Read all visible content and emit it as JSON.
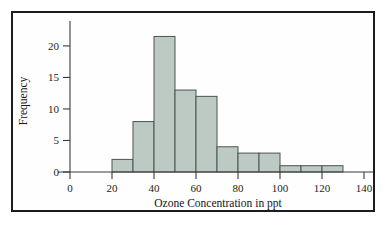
{
  "chart_data": {
    "type": "bar",
    "title": "",
    "subtitle": "",
    "xlabel": "Ozone Concentration in ppt",
    "ylabel": "Frequency",
    "xlim": [
      0,
      140
    ],
    "ylim": [
      0,
      23
    ],
    "bin_width": 10,
    "grid": false,
    "legend": null,
    "categories": [
      "20-30",
      "30-40",
      "40-50",
      "50-60",
      "60-70",
      "70-80",
      "80-90",
      "90-100",
      "100-110",
      "110-120",
      "120-130"
    ],
    "bin_starts": [
      20,
      30,
      40,
      50,
      60,
      70,
      80,
      90,
      100,
      110,
      120
    ],
    "bin_ends": [
      30,
      40,
      50,
      60,
      70,
      80,
      90,
      100,
      110,
      120,
      130
    ],
    "values": [
      2,
      8,
      21.5,
      13,
      12,
      4,
      3,
      3,
      1,
      1,
      1
    ],
    "xticks": [
      0,
      20,
      40,
      60,
      80,
      100,
      120,
      140
    ],
    "xtick_labels": [
      "0",
      "20",
      "40",
      "60",
      "80",
      "100",
      "120",
      "140"
    ],
    "yticks": [
      0,
      5,
      10,
      15,
      20
    ],
    "ytick_labels": [
      "0",
      "5",
      "10",
      "15",
      "20"
    ],
    "bar_fill_color": "#bdc9c3",
    "bar_edge_color": "#4b5550",
    "axis_color": "#3a3a3f",
    "frame_color": "#1c1c20",
    "background_color": "#ffffff"
  }
}
